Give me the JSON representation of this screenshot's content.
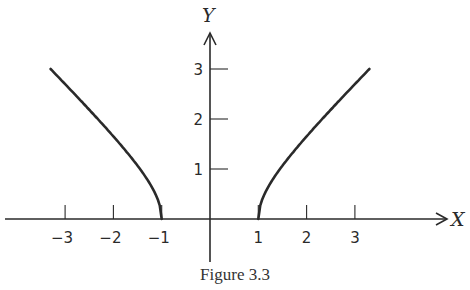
{
  "figure": {
    "caption": "Figure 3.3",
    "x_axis_label": "X",
    "y_axis_label": "Y",
    "x_ticks": [
      "-3",
      "-2",
      "-1",
      "1",
      "2",
      "3"
    ],
    "y_ticks": [
      "1",
      "2",
      "3"
    ],
    "ink_color": "#2a2a2a"
  },
  "chart_data": {
    "type": "line",
    "title": "Figure 3.3",
    "xlabel": "X",
    "ylabel": "Y",
    "xlim": [
      -4,
      5
    ],
    "ylim": [
      -0.8,
      3.7
    ],
    "grid": false,
    "legend": null,
    "x_tick_labels": [
      -3,
      -2,
      -1,
      1,
      2,
      3
    ],
    "y_tick_labels": [
      1,
      2,
      3
    ],
    "series": [
      {
        "name": "left branch",
        "x": [
          -3.3,
          -3,
          -2.5,
          -2,
          -1.5,
          -1.25,
          -1.1,
          -1
        ],
        "y": [
          3.0,
          2.83,
          2.29,
          1.73,
          1.12,
          0.75,
          0.46,
          0
        ]
      },
      {
        "name": "right branch",
        "x": [
          1,
          1.1,
          1.25,
          1.5,
          2,
          2.5,
          3,
          3.3
        ],
        "y": [
          0,
          0.46,
          0.75,
          1.12,
          1.73,
          2.29,
          2.83,
          3.0
        ]
      }
    ],
    "annotations": [
      "Curve resembles y = sqrt(x^2 - 1) for |x| >= 1"
    ]
  }
}
